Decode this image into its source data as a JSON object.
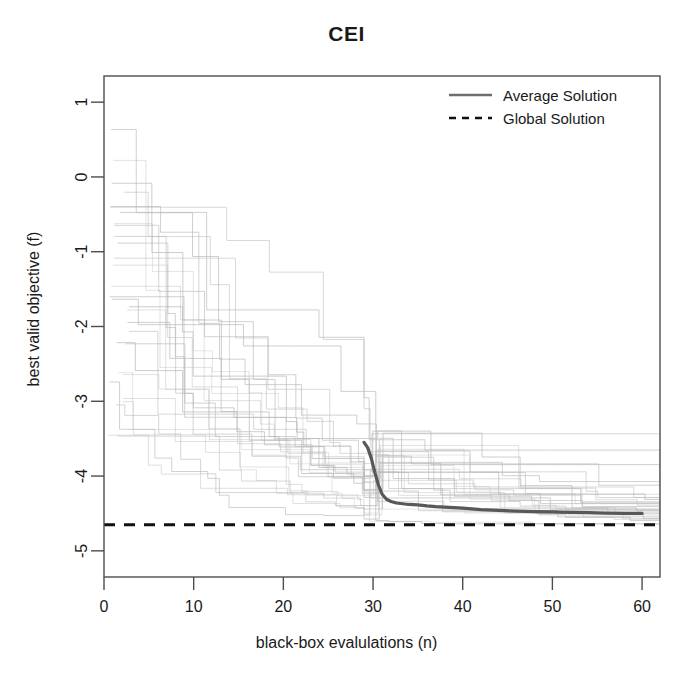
{
  "chart_data": {
    "type": "line",
    "title": "CEI",
    "xlabel": "black-box evalulations (n)",
    "ylabel": "best valid objective (f)",
    "xlim": [
      0,
      62
    ],
    "ylim": [
      -5.35,
      1.35
    ],
    "xticks": [
      0,
      10,
      20,
      30,
      40,
      50,
      60
    ],
    "xtick_labels": [
      "0",
      "10",
      "20",
      "30",
      "40",
      "50",
      "60"
    ],
    "yticks": [
      1,
      0,
      -1,
      -2,
      -3,
      -4,
      -5
    ],
    "ytick_labels": [
      "1",
      "0",
      "-1",
      "-2",
      "-3",
      "-4",
      "-5"
    ],
    "grid": false,
    "legend_position": "top-right",
    "legend": [
      {
        "label": "Average Solution",
        "style": "solid",
        "color": "#6e6e6e"
      },
      {
        "label": "Global Solution",
        "style": "dashed",
        "color": "#111111"
      }
    ],
    "global_solution_value": -4.65,
    "series": [
      {
        "name": "Average Solution",
        "style": "solid",
        "color": "#585858",
        "x": [
          29,
          29.4,
          29.8,
          30.2,
          30.6,
          31,
          31.5,
          32,
          32.6,
          33.3,
          34,
          35,
          36,
          37,
          38.5,
          40,
          42,
          44,
          46,
          48,
          50,
          52,
          54,
          56,
          58,
          60
        ],
        "y": [
          -3.55,
          -3.62,
          -3.76,
          -3.95,
          -4.12,
          -4.24,
          -4.31,
          -4.34,
          -4.36,
          -4.37,
          -4.38,
          -4.385,
          -4.4,
          -4.41,
          -4.42,
          -4.43,
          -4.45,
          -4.46,
          -4.47,
          -4.475,
          -4.48,
          -4.485,
          -4.49,
          -4.495,
          -4.5,
          -4.5
        ]
      },
      {
        "name": "Global Solution",
        "style": "dashed",
        "color": "#111111",
        "x": [
          0,
          62
        ],
        "y": [
          -4.65,
          -4.65
        ]
      }
    ],
    "traces_note": "30 light-gray monotone step traces of individual optimization runs, decreasing from roughly 0.7 down to about -4.7 over 60 evaluations, with a dense near-vertical bundle of drops at n = 30",
    "traces_color": "#b9b9b9",
    "traces_count": 30
  },
  "figure": {
    "background": "#ffffff",
    "frame_color": "#4d4d4d"
  }
}
